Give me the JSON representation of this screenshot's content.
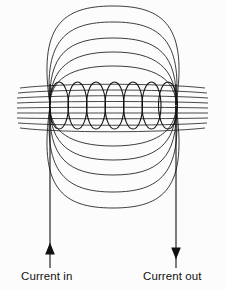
{
  "figure": {
    "type": "physics-diagram",
    "title": "",
    "background_color": "#fcfcfc",
    "line_color": "#1a1a1a",
    "width": 225,
    "height": 290
  },
  "labels": {
    "current_in": "Current in",
    "current_out": "Current out"
  },
  "diagram_data": {
    "coil": {
      "turns": 7,
      "left_x": 50,
      "right_x": 177,
      "top_y": 82,
      "bottom_y": 129,
      "turn_centers_x": [
        59,
        78,
        97,
        116,
        135,
        154,
        169
      ],
      "turn_rx": 9.5,
      "turn_ry": 23.5
    },
    "core_field_lines": {
      "count": 11,
      "x_start": 18,
      "x_end": 208,
      "y_top": 84,
      "y_bottom": 127,
      "description": "near-horizontal lines through coil interior"
    },
    "upper_field_loops": {
      "count": 5,
      "description": "nested arcs above the coil returning to the poles",
      "half_widths": [
        43,
        58,
        74,
        90,
        107
      ],
      "heights": [
        24,
        38,
        52,
        66,
        79
      ]
    },
    "lower_field_loops": {
      "count": 5,
      "description": "nested arcs below the coil returning to the poles",
      "half_widths": [
        43,
        58,
        74,
        90,
        107
      ],
      "heights": [
        26,
        40,
        54,
        68,
        81
      ]
    },
    "leads": [
      {
        "name": "current-in-lead",
        "x": 50,
        "y_top": 84,
        "y_bottom": 268,
        "arrow_direction": "up",
        "arrow_y": 250,
        "label": "Current in"
      },
      {
        "name": "current-out-lead",
        "x": 176,
        "y_top": 84,
        "y_bottom": 268,
        "arrow_direction": "down",
        "arrow_y": 250,
        "label": "Current out"
      }
    ]
  }
}
